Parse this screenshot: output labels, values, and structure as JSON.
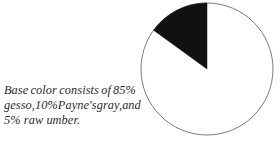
{
  "caption": {
    "full_text": "Base color consists of 85% gesso, 10% Payne's gray, and 5% raw umber.",
    "lines": [
      {
        "words": [
          "Base",
          "color",
          "consists",
          "of",
          "85%"
        ]
      },
      {
        "words": [
          "gesso,",
          "10%",
          "Payne's",
          "gray,",
          "and"
        ]
      },
      {
        "words": [
          "5% raw umber."
        ]
      }
    ],
    "line1_w1": "Base",
    "line1_w2": "color",
    "line1_w3": "consists",
    "line1_w4": "of",
    "line1_w5": "85%",
    "line2_w1": "gesso,",
    "line2_w2": "10%",
    "line2_w3": "Payne's",
    "line2_w4": "gray,",
    "line2_w5": "and",
    "line3": "5% raw umber."
  },
  "colors": {
    "background": "#ffffff",
    "text": "#2b2b2b",
    "wedge_fill": "#111111",
    "pie_stroke": "#6f6d6b",
    "slice_rest_fill": "#ffffff"
  },
  "chart_data": {
    "type": "pie",
    "title": "",
    "subtitle": "",
    "xlabel": "",
    "ylabel": "",
    "legend_position": "none",
    "grid": false,
    "labels": [
      "gesso",
      "Payne's gray + raw umber"
    ],
    "values": [
      85,
      15
    ],
    "units": "%",
    "colors": [
      "#ffffff",
      "#111111"
    ],
    "start_angle_deg": 90,
    "direction": "counterclockwise",
    "annotations": [],
    "components": [
      {
        "name": "gesso",
        "percent": 85
      },
      {
        "name": "Payne's gray",
        "percent": 10
      },
      {
        "name": "raw umber",
        "percent": 5
      }
    ],
    "geometry": {
      "center_x": 67,
      "center_y": 69,
      "radius": 66,
      "wedge_percent": 15
    }
  }
}
